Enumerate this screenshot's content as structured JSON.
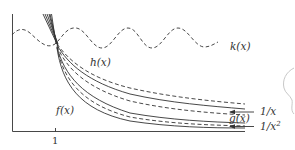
{
  "diagram": {
    "axes": {
      "x_tick_label": "1"
    },
    "labels": {
      "k": "k(x)",
      "h": "h(x)",
      "f": "f(x)",
      "g": "g(x)",
      "one_over_x": "1/x",
      "one_over_x2": "1/x",
      "one_over_x2_exponent": "2"
    },
    "curves": [
      {
        "name": "k(x)",
        "style": "dashed",
        "shape": "sinusoid"
      },
      {
        "name": "h(x)",
        "style": "dashed",
        "shape": "decreasing"
      },
      {
        "name": "1/x",
        "style": "solid",
        "shape": "decreasing"
      },
      {
        "name": "g(x)",
        "style": "dashed",
        "shape": "decreasing"
      },
      {
        "name": "f(x)",
        "style": "solid",
        "shape": "decreasing"
      },
      {
        "name": "1/x^2",
        "style": "solid",
        "shape": "decreasing"
      }
    ],
    "colors": {
      "ink": "#333333",
      "background": "#ffffff",
      "sketch": "#c8c8c8"
    }
  }
}
